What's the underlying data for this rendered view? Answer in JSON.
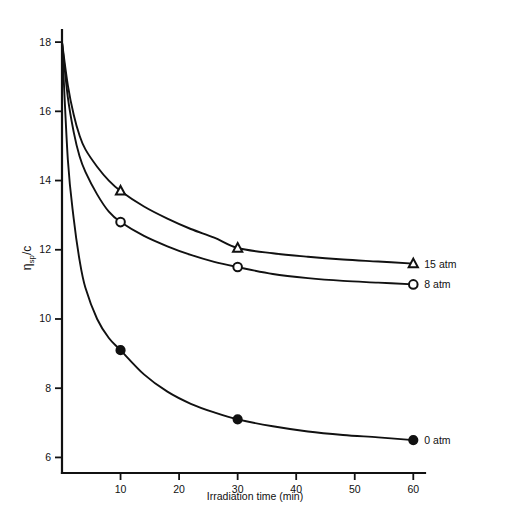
{
  "chart_data": {
    "type": "line",
    "title": "",
    "xlabel": "Irradiation time (min)",
    "ylabel": "ηsp/c",
    "ylabel_main": "η",
    "ylabel_sub": "sp",
    "ylabel_tail": "/c",
    "xlim": [
      0,
      62
    ],
    "ylim": [
      5.55,
      18.35
    ],
    "xticks": [
      10,
      20,
      30,
      40,
      50,
      60
    ],
    "yticks": [
      6,
      8,
      10,
      12,
      14,
      16,
      18
    ],
    "xtick_labels": [
      "10",
      "20",
      "30",
      "40",
      "50",
      "60"
    ],
    "ytick_labels": [
      "6",
      "8",
      "10",
      "12",
      "14",
      "16",
      "18"
    ],
    "grid": false,
    "legend_position": "right-inline",
    "series": [
      {
        "name": "15 atm",
        "marker": "open-triangle",
        "label": "15 atm",
        "x": [
          0,
          1,
          2,
          3,
          4,
          6,
          8,
          10,
          14,
          18,
          22,
          26,
          30,
          36,
          42,
          48,
          54,
          60
        ],
        "y": [
          18.0,
          16.75,
          15.9,
          15.3,
          14.9,
          14.4,
          14.0,
          13.7,
          13.25,
          12.9,
          12.6,
          12.35,
          12.05,
          11.9,
          11.8,
          11.72,
          11.66,
          11.6
        ]
      },
      {
        "name": "8 atm",
        "marker": "open-circle",
        "label": "8 atm",
        "x": [
          0,
          1,
          2,
          3,
          4,
          6,
          8,
          10,
          14,
          18,
          22,
          26,
          30,
          36,
          42,
          48,
          54,
          60
        ],
        "y": [
          18.0,
          16.4,
          15.4,
          14.7,
          14.25,
          13.6,
          13.1,
          12.8,
          12.4,
          12.1,
          11.85,
          11.65,
          11.5,
          11.3,
          11.18,
          11.1,
          11.05,
          11.0
        ]
      },
      {
        "name": "0 atm",
        "marker": "filled-circle",
        "label": "0 atm",
        "x": [
          0,
          1,
          2,
          3,
          4,
          6,
          8,
          10,
          14,
          18,
          22,
          26,
          30,
          36,
          42,
          48,
          54,
          60
        ],
        "y": [
          18.0,
          14.6,
          12.9,
          11.7,
          10.9,
          10.0,
          9.45,
          9.1,
          8.4,
          7.9,
          7.55,
          7.3,
          7.1,
          6.9,
          6.75,
          6.65,
          6.58,
          6.5
        ]
      }
    ],
    "data_points": [
      {
        "series": "15 atm",
        "x": 10,
        "y": 13.7
      },
      {
        "series": "15 atm",
        "x": 30,
        "y": 12.05
      },
      {
        "series": "15 atm",
        "x": 60,
        "y": 11.6
      },
      {
        "series": "8 atm",
        "x": 10,
        "y": 12.8
      },
      {
        "series": "8 atm",
        "x": 30,
        "y": 11.5
      },
      {
        "series": "8 atm",
        "x": 60,
        "y": 11.0
      },
      {
        "series": "0 atm",
        "x": 10,
        "y": 9.1
      },
      {
        "series": "0 atm",
        "x": 30,
        "y": 7.1
      },
      {
        "series": "0 atm",
        "x": 60,
        "y": 6.5
      }
    ],
    "colors": {
      "axis": "#111111",
      "curve": "#111111",
      "background": "#ffffff"
    }
  }
}
